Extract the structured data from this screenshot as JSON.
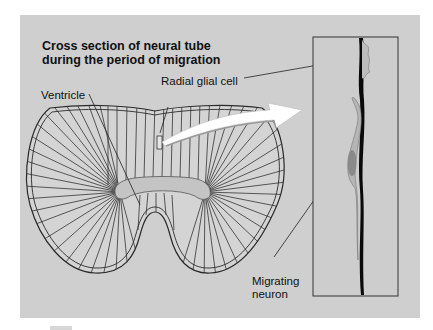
{
  "figure": {
    "title_line1": "Cross section of neural tube",
    "title_line2": "during the period of migration",
    "labels": {
      "ventricle": "Ventricle",
      "radial_glial_cell": "Radial glial cell",
      "migrating_neuron_line1": "Migrating",
      "migrating_neuron_line2": "neuron"
    },
    "colors": {
      "background": "#ffffff",
      "panel": "#cfcfcf",
      "tissue": "#d4d4d4",
      "ventricle": "#c4c4c4",
      "lines": "#2a2a2a",
      "glial_fiber": "#0a0a0a",
      "neuron_body": "#8a8a8a",
      "arrow": "#ffffff"
    }
  }
}
